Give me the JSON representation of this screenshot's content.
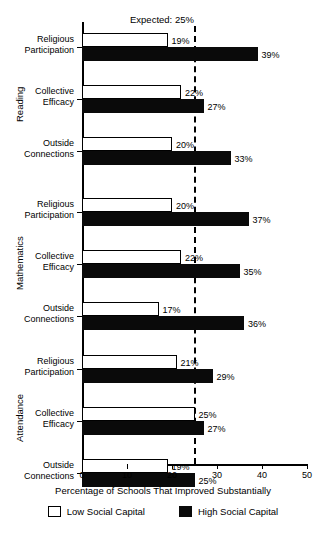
{
  "chart_data": {
    "type": "bar",
    "orientation": "horizontal",
    "title": "",
    "xlabel": "Percentage of Schools That Improved Substantially",
    "ylabel": "",
    "xlim": [
      0,
      50
    ],
    "xticks": [
      0,
      10,
      20,
      30,
      40,
      50
    ],
    "xtick_labels": [
      "0",
      "10",
      "20",
      "30",
      "40",
      "50"
    ],
    "grid": false,
    "legend_position": "bottom",
    "legend": [
      "Low Social Capital",
      "High Social Capital"
    ],
    "reference_line": {
      "label": "Expected: 25%",
      "value": 25,
      "style": "dashed"
    },
    "panels": [
      {
        "name": "Reading",
        "categories": [
          "Religious Participation",
          "Collective Efficacy",
          "Outside Connections"
        ],
        "series": [
          {
            "name": "Low Social Capital",
            "values": [
              19,
              22,
              20
            ]
          },
          {
            "name": "High Social Capital",
            "values": [
              39,
              27,
              33
            ]
          }
        ]
      },
      {
        "name": "Mathematics",
        "categories": [
          "Religious Participation",
          "Collective Efficacy",
          "Outside Connections"
        ],
        "series": [
          {
            "name": "Low Social Capital",
            "values": [
              20,
              22,
              17
            ]
          },
          {
            "name": "High Social Capital",
            "values": [
              37,
              35,
              36
            ]
          }
        ]
      },
      {
        "name": "Attendance",
        "categories": [
          "Religious Participation",
          "Collective Efficacy",
          "Outside Connections"
        ],
        "series": [
          {
            "name": "Low Social Capital",
            "values": [
              21,
              25,
              19
            ]
          },
          {
            "name": "High Social Capital",
            "values": [
              29,
              27,
              25
            ]
          }
        ]
      }
    ],
    "value_labels": [
      "19%",
      "39%",
      "22%",
      "27%",
      "20%",
      "33%",
      "20%",
      "37%",
      "22%",
      "35%",
      "17%",
      "36%",
      "21%",
      "29%",
      "25%",
      "27%",
      "19%",
      "25%"
    ]
  },
  "axis": {
    "x_title": "Percentage of Schools That Improved Substantially",
    "tick_labels": [
      "0",
      "10",
      "20",
      "30",
      "40",
      "50"
    ]
  },
  "annotation": {
    "expected": "Expected: 25%"
  },
  "legend": {
    "low_label": "Low Social Capital",
    "high_label": "High Social Capital"
  },
  "groups": {
    "reading": "Reading",
    "mathematics": "Mathematics",
    "attendance": "Attendance"
  },
  "categories": {
    "religious_line1": "Religious",
    "religious_line2": "Participation",
    "collective_line1": "Collective",
    "collective_line2": "Efficacy",
    "outside_line1": "Outside",
    "outside_line2": "Connections"
  },
  "colors": {
    "low_fill": "#ffffff",
    "high_fill": "#0a0a0a",
    "axis": "#000000"
  }
}
